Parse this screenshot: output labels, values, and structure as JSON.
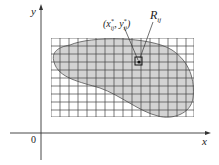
{
  "figure": {
    "axes": {
      "x_label": "x",
      "y_label": "y",
      "origin_label": "0"
    },
    "point_label": {
      "base": "(x",
      "sup1": "*",
      "sub1": "ij",
      "mid": ", y",
      "sup2": "*",
      "sub2": "ij",
      "end": ")"
    },
    "rect_label": {
      "base": "R",
      "sub": "ij"
    },
    "grid": {
      "columns": 16,
      "rows": 10
    },
    "colors": {
      "region_fill": "#d3d3d3",
      "line": "#333333",
      "grid": "#444444"
    }
  }
}
